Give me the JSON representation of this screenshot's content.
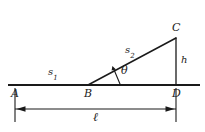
{
  "figure": {
    "stroke_color": "#1a1a1a",
    "background_color": "#ffffff",
    "points": {
      "A": {
        "label": "A",
        "x": 15,
        "y": 85
      },
      "B": {
        "label": "B",
        "x": 88,
        "y": 85
      },
      "C": {
        "label": "C",
        "x": 176,
        "y": 38
      },
      "D": {
        "label": "D",
        "x": 176,
        "y": 85
      }
    },
    "segments": {
      "s1": {
        "label": "s",
        "subscript": "1",
        "from": "A",
        "to": "B"
      },
      "s2": {
        "label": "s",
        "subscript": "2",
        "from": "B",
        "to": "C"
      },
      "h": {
        "label": "h",
        "from": "C",
        "to": "D"
      },
      "ell": {
        "label": "ℓ",
        "from": "A",
        "to": "D"
      }
    },
    "angle": {
      "label": "θ",
      "vertex": "B"
    }
  }
}
